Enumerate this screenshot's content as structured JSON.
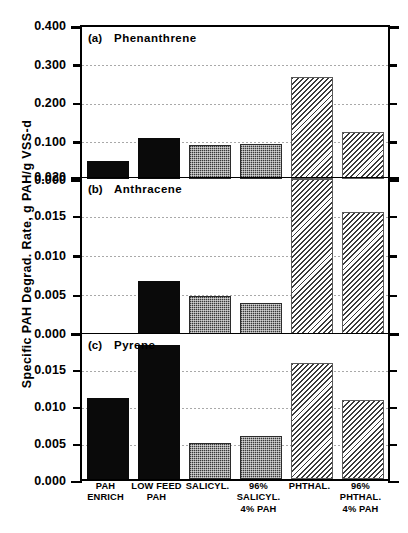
{
  "chart_data": {
    "type": "bar",
    "title": "",
    "ylabel": "Specific  PAH  Degrad.  Rate,  g  PAH/g  VSS-d",
    "xlabel": "",
    "grid": true,
    "legend": "none",
    "categories": [
      "PAH\nENRICH",
      "LOW FEED\nPAH",
      "SALICYL.",
      "96%\nSALICYL.\n4% PAH",
      "PHTHAL.",
      "96%\nPHTHAL.\n4% PAH"
    ],
    "panels": [
      {
        "key": "a",
        "panel_label": "(a)",
        "name": "Phenanthrene",
        "ylim": [
          0.0,
          0.4
        ],
        "yticks": [
          0.0,
          0.1,
          0.2,
          0.3,
          0.4
        ],
        "yticklabels": [
          "0.000",
          "0.100",
          "0.200",
          "0.300",
          "0.400"
        ],
        "values": [
          0.046,
          0.106,
          0.088,
          0.09,
          0.265,
          0.121
        ],
        "fills": [
          "solid",
          "solid",
          "stipple",
          "stipple",
          "hatch",
          "hatch"
        ]
      },
      {
        "key": "b",
        "panel_label": "(b)",
        "name": "Anthracene",
        "ylim": [
          0.0,
          0.02
        ],
        "yticks": [
          0.0,
          0.005,
          0.01,
          0.015,
          0.02
        ],
        "yticklabels": [
          "0.000",
          "0.005",
          "0.010",
          "0.015",
          "0.020"
        ],
        "values": [
          0.0,
          0.0068,
          0.0049,
          0.0039,
          0.0198,
          0.0156
        ],
        "fills": [
          "solid",
          "solid",
          "stipple",
          "stipple",
          "hatch",
          "hatch"
        ]
      },
      {
        "key": "c",
        "panel_label": "(c)",
        "name": "Pyrene",
        "ylim": [
          0.0,
          0.02
        ],
        "yticks": [
          0.0,
          0.005,
          0.01,
          0.015,
          0.02
        ],
        "yticklabels": [
          "0.000",
          "0.005",
          "0.010",
          "0.015",
          ""
        ],
        "values": [
          0.0109,
          0.0181,
          0.0049,
          0.0058,
          0.0157,
          0.0107
        ],
        "fills": [
          "solid",
          "solid",
          "stipple",
          "stipple",
          "hatch",
          "hatch"
        ]
      }
    ],
    "colors": {
      "solid": "#0a0a0a",
      "stipple": "#7e7e7e",
      "hatch": "#c9c9c9",
      "axis": "#000000",
      "grid": "#8c8c8c"
    }
  }
}
